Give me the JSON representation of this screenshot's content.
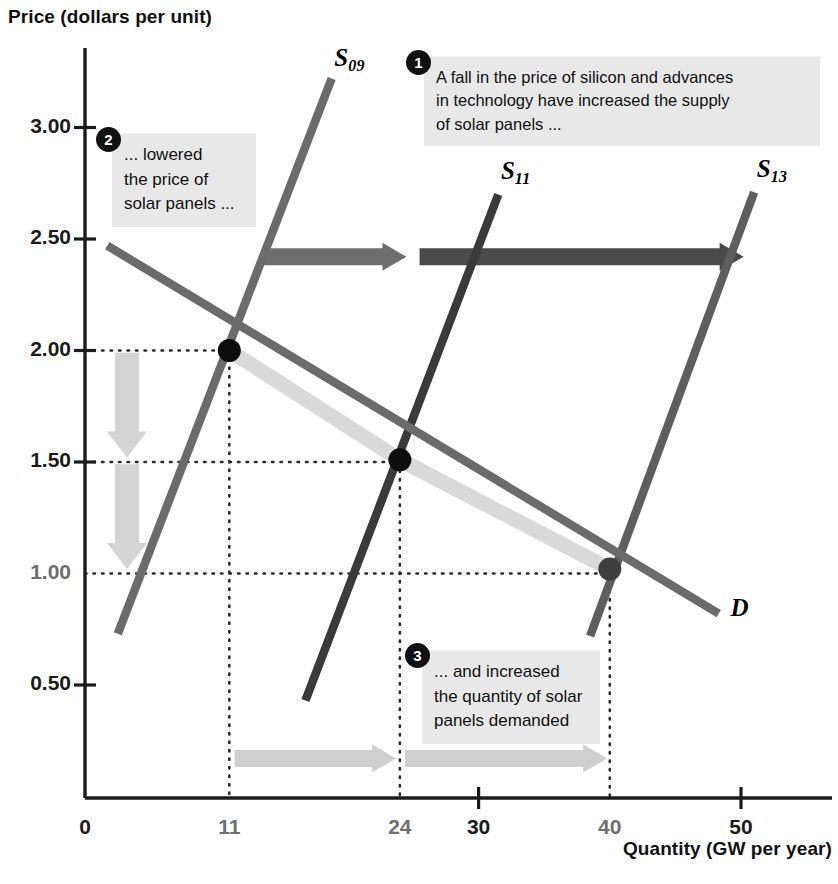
{
  "figure": {
    "title_y": "Price (dollars per unit)",
    "title_x": "Quantity (GW per year)"
  },
  "chart_data": {
    "type": "line",
    "title": "",
    "xlabel": "Quantity (GW per year)",
    "ylabel": "Price (dollars per unit)",
    "xlim": [
      0,
      56
    ],
    "ylim": [
      0,
      3.35
    ],
    "grid": false,
    "legend": "inline-curve-labels",
    "x_ticks": [
      {
        "value": 0,
        "label": "0",
        "major": true
      },
      {
        "value": 11,
        "label": "11",
        "major": false
      },
      {
        "value": 24,
        "label": "24",
        "major": false
      },
      {
        "value": 30,
        "label": "30",
        "major": true
      },
      {
        "value": 40,
        "label": "40",
        "major": false
      },
      {
        "value": 50,
        "label": "50",
        "major": true
      }
    ],
    "y_ticks": [
      {
        "value": 0.5,
        "label": "0.50",
        "major": true
      },
      {
        "value": 1.0,
        "label": "1.00",
        "major": false
      },
      {
        "value": 1.5,
        "label": "1.50",
        "major": true
      },
      {
        "value": 2.0,
        "label": "2.00",
        "major": true
      },
      {
        "value": 2.5,
        "label": "2.50",
        "major": true
      },
      {
        "value": 3.0,
        "label": "3.00",
        "major": true
      }
    ],
    "series": [
      {
        "name": "S09",
        "label": "S",
        "sublabel": "09",
        "kind": "supply",
        "color": "#6b6b6b",
        "points": [
          [
            2.5,
            0.73
          ],
          [
            18.8,
            3.22
          ]
        ],
        "label_pos": [
          19.0,
          3.3
        ]
      },
      {
        "name": "S11",
        "label": "S",
        "sublabel": "11",
        "kind": "supply",
        "color": "#3a3a3a",
        "points": [
          [
            16.8,
            0.43
          ],
          [
            31.5,
            2.7
          ]
        ],
        "label_pos": [
          31.7,
          2.79
        ]
      },
      {
        "name": "S13",
        "label": "S",
        "sublabel": "13",
        "kind": "supply",
        "color": "#5e5e5e",
        "points": [
          [
            38.5,
            0.72
          ],
          [
            51.0,
            2.71
          ]
        ],
        "label_pos": [
          51.2,
          2.8
        ]
      },
      {
        "name": "D",
        "label": "D",
        "sublabel": "",
        "kind": "demand",
        "color": "#6b6b6b",
        "points": [
          [
            1.7,
            2.47
          ],
          [
            48.3,
            0.82
          ]
        ],
        "label_pos": [
          49.2,
          0.83
        ]
      }
    ],
    "equilibria": [
      {
        "x": 11,
        "y": 2.0,
        "label": "2009 equilibrium"
      },
      {
        "x": 24,
        "y": 1.51,
        "label": "2011 equilibrium"
      },
      {
        "x": 40,
        "y": 1.02,
        "label": "2013 equilibrium"
      }
    ],
    "drop_lines": [
      {
        "x": 11,
        "y": 2.0
      },
      {
        "x": 24,
        "y": 1.5
      },
      {
        "x": 40,
        "y": 1.0
      }
    ],
    "shift_arrows": [
      {
        "from": [
          13.5,
          2.42
        ],
        "to": [
          24.5,
          2.42
        ],
        "color": "#6e6e6e",
        "orient": "h"
      },
      {
        "from": [
          25.5,
          2.42
        ],
        "to": [
          50.2,
          2.42
        ],
        "color": "#4a4a4a",
        "orient": "h"
      }
    ],
    "price_arrows": [
      {
        "from": [
          3.2,
          1.99
        ],
        "to": [
          3.2,
          1.52
        ],
        "color": "#d4d4d4",
        "orient": "v"
      },
      {
        "from": [
          3.2,
          1.49
        ],
        "to": [
          3.2,
          1.02
        ],
        "color": "#d4d4d4",
        "orient": "v"
      }
    ],
    "quantity_arrows": [
      {
        "from": [
          11.4,
          0.17
        ],
        "to": [
          23.7,
          0.17
        ],
        "color": "#cfcfcf",
        "orient": "h"
      },
      {
        "from": [
          24.4,
          0.17
        ],
        "to": [
          39.8,
          0.17
        ],
        "color": "#cfcfcf",
        "orient": "h"
      }
    ],
    "highlight_band": {
      "color": "#d9d9d9",
      "points": [
        [
          11,
          2.0
        ],
        [
          24,
          1.51
        ],
        [
          40,
          1.02
        ]
      ]
    }
  },
  "callouts": [
    {
      "number": "1",
      "text": "A fall in the price of silicon and advances in technology have increased the supply of solar panels ...",
      "lines": [
        "A fall in the price of silicon and advances",
        "in technology have increased the supply",
        "of solar panels ..."
      ],
      "left": 424,
      "top": 56,
      "width": 396,
      "badge_left": 406,
      "badge_top": 50
    },
    {
      "number": "2",
      "text": "... lowered the price of solar panels ...",
      "lines": [
        "... lowered",
        "the price of",
        "solar panels ..."
      ],
      "left": 112,
      "top": 133,
      "width": 144,
      "badge_left": 96,
      "badge_top": 127
    },
    {
      "number": "3",
      "text": "... and increased the quantity of solar panels demanded",
      "lines": [
        "... and increased",
        "the quantity of solar",
        "panels demanded"
      ],
      "left": 422,
      "top": 650,
      "width": 178,
      "badge_left": 405,
      "badge_top": 643
    }
  ],
  "colors": {
    "axis": "#1b1b1b",
    "supply_2009": "#6b6b6b",
    "supply_2011": "#3a3a3a",
    "supply_2013": "#5e5e5e",
    "demand": "#6b6b6b",
    "callout_bg": "#e8e8e8",
    "badge_bg": "#111111",
    "shift_arrow_light": "#6e6e6e",
    "shift_arrow_dark": "#4a4a4a",
    "quantity_arrow": "#cfcfcf",
    "price_arrow": "#d4d4d4",
    "highlight_band": "#d9d9d9"
  }
}
